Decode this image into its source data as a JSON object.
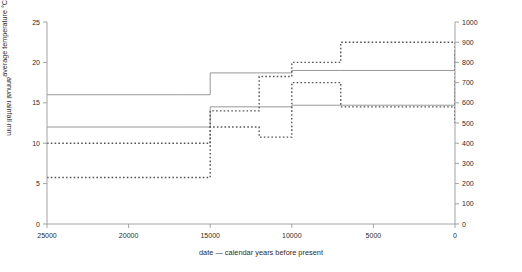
{
  "chart_data": {
    "type": "line",
    "title": "",
    "xlabel": "date  —  calendar years before present",
    "ylabel": "average temperature  °C",
    "y2label": "annual rainfall  mm",
    "xlim": [
      25000,
      0
    ],
    "xreversed": true,
    "ylim": [
      0,
      25
    ],
    "y2lim": [
      0,
      1000
    ],
    "grid": false,
    "legend": false,
    "xticks": [
      25000,
      20000,
      15000,
      10000,
      5000,
      0
    ],
    "xticklabels": [
      "25000",
      "20000",
      "15000",
      "10000",
      "5000",
      "0"
    ],
    "yticks": [
      0,
      5,
      10,
      15,
      20,
      25
    ],
    "yticklabels": [
      "0",
      "5",
      "10",
      "15",
      "20",
      "25"
    ],
    "y2ticks": [
      0,
      100,
      200,
      300,
      400,
      500,
      600,
      700,
      800,
      900,
      1000
    ],
    "y2ticklabels": [
      "0",
      "100",
      "200",
      "300",
      "400",
      "500",
      "600",
      "700",
      "800",
      "900",
      "1000"
    ],
    "step_style": "post",
    "series": [
      {
        "name": "maximum average temperature",
        "axis": "left",
        "style": "solid",
        "color": "#8c8c8c",
        "x": [
          25000,
          17000,
          15000,
          12000,
          10000,
          7000,
          0
        ],
        "values": [
          16.0,
          16.0,
          18.7,
          18.7,
          19.0,
          19.0,
          21.5
        ]
      },
      {
        "name": "minimum average temperature",
        "axis": "left",
        "style": "solid",
        "color": "#8c8c8c",
        "x": [
          25000,
          17000,
          15000,
          12000,
          10000,
          7000,
          0
        ],
        "values": [
          12.0,
          12.0,
          14.5,
          14.5,
          14.7,
          14.7,
          17.7
        ]
      },
      {
        "name": "maximum annual rainfall",
        "axis": "right",
        "style": "dashed",
        "color": "#555555",
        "x": [
          25000,
          17000,
          15000,
          12000,
          10000,
          7000,
          0
        ],
        "values": [
          400,
          400,
          560,
          730,
          800,
          900,
          500
        ]
      },
      {
        "name": "minimum annual rainfall",
        "axis": "right",
        "style": "dashed",
        "color": "#555555",
        "x": [
          25000,
          17000,
          15000,
          12000,
          10000,
          7000,
          0
        ],
        "values": [
          230,
          230,
          480,
          430,
          700,
          580,
          500
        ]
      }
    ]
  }
}
